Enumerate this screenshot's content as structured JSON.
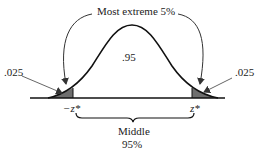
{
  "title": "Most extreme 5%",
  "center_label": ".95",
  "left_tail_label": ".025",
  "right_tail_label": ".025",
  "left_critical": "−z*",
  "right_critical": "z*",
  "middle_label_line1": "Middle",
  "middle_label_line2": "95%",
  "colors": {
    "curve": "#111111",
    "tail_fill": "#6e6e6e",
    "arrow": "#555555",
    "text": "#222222"
  }
}
